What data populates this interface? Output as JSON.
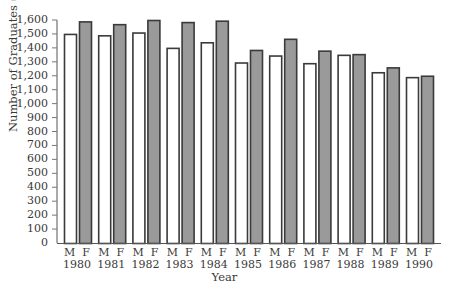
{
  "chart_data": {
    "type": "bar",
    "title": "",
    "xlabel": "Year",
    "ylabel": "Number of Graduates (in thousands)",
    "ylim": [
      0,
      1600
    ],
    "ytick_step": 100,
    "yticks": [
      "0",
      "100",
      "200",
      "300",
      "400",
      "500",
      "600",
      "700",
      "800",
      "900",
      "1,000",
      "1,100",
      "1,200",
      "1,300",
      "1,400",
      "1,500",
      "1,600"
    ],
    "grid": false,
    "legend": null,
    "categories": [
      "1980",
      "1981",
      "1982",
      "1983",
      "1984",
      "1985",
      "1986",
      "1987",
      "1988",
      "1989",
      "1990"
    ],
    "bar_labels": [
      "M",
      "F"
    ],
    "series": [
      {
        "name": "M",
        "fill": "#ffffff",
        "stroke": "#3a3a3a",
        "values": [
          1500,
          1490,
          1510,
          1400,
          1440,
          1295,
          1345,
          1290,
          1350,
          1225,
          1190
        ]
      },
      {
        "name": "F",
        "fill": "#9a9a9a",
        "stroke": "#3a3a3a",
        "values": [
          1590,
          1570,
          1600,
          1585,
          1595,
          1385,
          1465,
          1380,
          1355,
          1260,
          1200
        ]
      }
    ]
  },
  "layout": {
    "plot_left": 57,
    "plot_top": 20,
    "plot_bottom": 243,
    "group_start": 64,
    "group_width": 34.2,
    "bar_width": 12,
    "bar_gap": 3
  }
}
